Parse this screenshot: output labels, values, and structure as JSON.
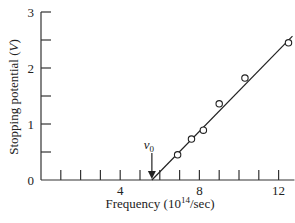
{
  "chart_data": {
    "type": "scatter",
    "title": "",
    "xlabel": "Frequency (10^14/sec)",
    "xlabel_parts": {
      "prefix": "Frequency (10",
      "sup": "14",
      "suffix": "/sec)"
    },
    "ylabel": "Stopping potential (V)",
    "ylabel_parts": {
      "prefix": "Stopping potential (",
      "italic": "V",
      "suffix": ")"
    },
    "xlim": [
      0,
      12.8
    ],
    "ylim": [
      0,
      3
    ],
    "x_ticks_major": [
      4,
      8,
      12
    ],
    "x_ticks_minor": [
      1,
      2,
      3,
      5,
      6,
      7,
      9,
      10,
      11
    ],
    "y_ticks_major": [
      0,
      1,
      2,
      3
    ],
    "y_ticks_minor": [
      0.5,
      1.5,
      2.5
    ],
    "x_tick_labels": [
      "4",
      "8",
      "12"
    ],
    "y_tick_labels": [
      "0",
      "1",
      "2",
      "3"
    ],
    "grid": false,
    "legend": null,
    "series": [
      {
        "name": "measured",
        "marker": "open-circle",
        "x": [
          6.9,
          7.6,
          8.2,
          9.0,
          10.3,
          12.5
        ],
        "y": [
          0.45,
          0.73,
          0.89,
          1.36,
          1.82,
          2.45
        ]
      },
      {
        "name": "linear fit",
        "style": "line",
        "x": [
          5.6,
          12.7
        ],
        "y": [
          0.0,
          2.57
        ]
      }
    ],
    "annotations": [
      {
        "text": "ν0",
        "main": "ν",
        "sub": "0",
        "x": 5.6,
        "y": 0,
        "type": "arrow-down",
        "meaning": "threshold frequency"
      }
    ]
  },
  "labels": {
    "y_axis": {
      "prefix": "Stopping potential (",
      "italic": "V",
      "suffix": ")"
    },
    "x_axis": {
      "prefix": "Frequency (10",
      "sup": "14",
      "suffix": "/sec)"
    },
    "nu0": {
      "main": "ν",
      "sub": "0"
    },
    "yticks": [
      "0",
      "1",
      "2",
      "3"
    ],
    "xticks": [
      "4",
      "8",
      "12"
    ]
  }
}
